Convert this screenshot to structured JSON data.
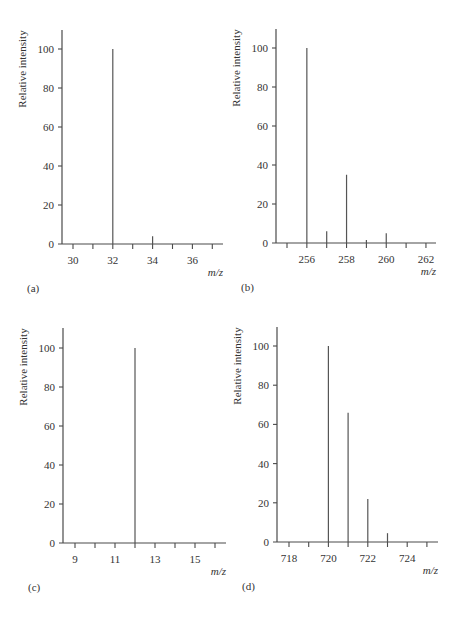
{
  "figure": {
    "panels": [
      {
        "id": "a",
        "label": "(a)"
      },
      {
        "id": "b",
        "label": "(b)"
      },
      {
        "id": "c",
        "label": "(c)"
      },
      {
        "id": "d",
        "label": "(d)"
      }
    ]
  },
  "chart_data": [
    {
      "type": "bar",
      "panel_label": "(a)",
      "title": "",
      "xlabel": "m/z",
      "ylabel": "Relative intensity",
      "x": [
        32,
        34
      ],
      "values": [
        100,
        4
      ],
      "x_ticks": [
        30,
        31,
        32,
        33,
        34,
        35,
        36,
        37
      ],
      "x_tick_labels": [
        "30",
        "32",
        "34",
        "36"
      ],
      "y_ticks": [
        0,
        20,
        40,
        60,
        80,
        100
      ],
      "xlim": [
        29.5,
        37.5
      ],
      "ylim": [
        0,
        110
      ],
      "grid": false,
      "legend": null
    },
    {
      "type": "bar",
      "panel_label": "(b)",
      "title": "",
      "xlabel": "m/z",
      "ylabel": "Relative intensity",
      "x": [
        256,
        257,
        258,
        259,
        260
      ],
      "values": [
        100,
        6,
        35,
        1.5,
        5
      ],
      "x_ticks": [
        255,
        256,
        257,
        258,
        259,
        260,
        261,
        262
      ],
      "x_tick_labels": [
        "256",
        "258",
        "260",
        "262"
      ],
      "y_ticks": [
        0,
        20,
        40,
        60,
        80,
        100
      ],
      "xlim": [
        254.5,
        262.5
      ],
      "ylim": [
        0,
        110
      ],
      "grid": false,
      "legend": null
    },
    {
      "type": "bar",
      "panel_label": "(c)",
      "title": "",
      "xlabel": "m/z",
      "ylabel": "Relative intensity",
      "x": [
        12
      ],
      "values": [
        100
      ],
      "x_ticks": [
        9,
        10,
        11,
        12,
        13,
        14,
        15,
        16
      ],
      "x_tick_labels": [
        "9",
        "11",
        "13",
        "15"
      ],
      "y_ticks": [
        0,
        20,
        40,
        60,
        80,
        100
      ],
      "xlim": [
        8.5,
        16.5
      ],
      "ylim": [
        0,
        110
      ],
      "grid": false,
      "legend": null
    },
    {
      "type": "bar",
      "panel_label": "(d)",
      "title": "",
      "xlabel": "m/z",
      "ylabel": "Relative intensity",
      "x": [
        720,
        721,
        722,
        723
      ],
      "values": [
        100,
        66,
        22,
        4.5
      ],
      "x_ticks": [
        718,
        719,
        720,
        721,
        722,
        723,
        724,
        725
      ],
      "x_tick_labels": [
        "718",
        "720",
        "722",
        "724"
      ],
      "y_ticks": [
        0,
        20,
        40,
        60,
        80,
        100
      ],
      "xlim": [
        717.5,
        725.5
      ],
      "ylim": [
        0,
        110
      ],
      "grid": false,
      "legend": null
    }
  ]
}
